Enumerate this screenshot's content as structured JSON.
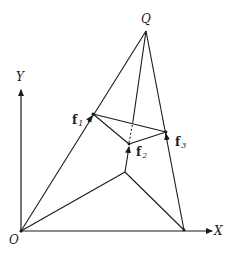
{
  "diagram": {
    "axes": {
      "x_label": "X",
      "y_label": "Y",
      "origin_label": "O"
    },
    "apex_label": "Q",
    "points": [
      {
        "id": "f1",
        "label": "f",
        "subscript": "1"
      },
      {
        "id": "f2",
        "label": "f",
        "subscript": "2"
      },
      {
        "id": "f3",
        "label": "f",
        "subscript": "3"
      }
    ],
    "colors": {
      "line": "#1a1a1a",
      "background": "#ffffff"
    }
  }
}
